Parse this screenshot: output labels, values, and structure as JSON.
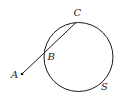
{
  "diagram": {
    "colors": {
      "stroke": "#1a1a1a",
      "background": "#ffffff"
    },
    "circle": {
      "name": "S",
      "cx": 78.5,
      "cy": 57,
      "r": 34.5
    },
    "points": {
      "A": {
        "label": "A",
        "x": 22,
        "y": 74
      },
      "B": {
        "label": "B",
        "x": 45,
        "y": 53
      },
      "C": {
        "label": "C",
        "x": 76,
        "y": 22.5
      }
    },
    "labels": {
      "A": "A",
      "B": "B",
      "C": "C",
      "S": "S"
    }
  }
}
